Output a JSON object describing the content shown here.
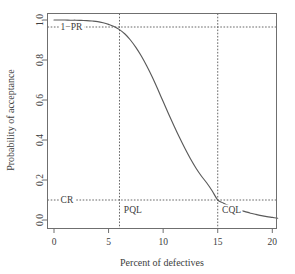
{
  "chart_data": {
    "type": "line",
    "title": "",
    "xlabel": "Percent of defectives",
    "ylabel": "Probability of acceptance",
    "xlim": [
      0,
      20.5
    ],
    "ylim": [
      0.0,
      1.0
    ],
    "grid": false,
    "legend": null,
    "xticks": [
      0,
      5,
      10,
      15,
      20
    ],
    "xtick_labels": [
      "0",
      "5",
      "10",
      "15",
      "20"
    ],
    "yticks": [
      0.0,
      0.2,
      0.4,
      0.6,
      0.8,
      1.0
    ],
    "ytick_labels": [
      "0.0",
      "0.2",
      "0.4",
      "0.6",
      "0.8",
      "1.0"
    ],
    "series": [
      {
        "name": "OC curve",
        "color": "#5a5a5a",
        "x": [
          0.0,
          0.5,
          1.0,
          1.5,
          2.0,
          2.5,
          3.0,
          3.5,
          4.0,
          4.5,
          5.0,
          5.5,
          6.0,
          6.5,
          7.0,
          7.5,
          8.0,
          8.5,
          9.0,
          9.5,
          10.0,
          10.5,
          11.0,
          11.5,
          12.0,
          12.5,
          13.0,
          13.5,
          14.0,
          14.5,
          15.0,
          15.5,
          16.0,
          16.5,
          17.0,
          17.5,
          18.0,
          18.5,
          19.0,
          19.5,
          20.0,
          20.5
        ],
        "y": [
          1.0,
          1.0,
          1.0,
          0.999,
          0.999,
          0.998,
          0.997,
          0.995,
          0.992,
          0.986,
          0.978,
          0.968,
          0.952,
          0.93,
          0.9,
          0.863,
          0.82,
          0.77,
          0.715,
          0.655,
          0.592,
          0.53,
          0.47,
          0.412,
          0.357,
          0.306,
          0.26,
          0.22,
          0.185,
          0.145,
          0.1,
          0.085,
          0.072,
          0.06,
          0.05,
          0.042,
          0.034,
          0.028,
          0.022,
          0.017,
          0.013,
          0.009
        ]
      }
    ],
    "annotations": [
      {
        "id": "one-minus-pr",
        "label": "1−PR",
        "type": "hline",
        "y": 0.965,
        "label_x": 0.6,
        "label_y": 0.965
      },
      {
        "id": "consumer-risk",
        "label": "CR",
        "type": "hline",
        "y": 0.1,
        "label_x": 0.6,
        "label_y": 0.1
      },
      {
        "id": "pql",
        "label": "PQL",
        "type": "vline",
        "x": 6.0,
        "label_x": 6.4,
        "label_y": 0.035
      },
      {
        "id": "cql",
        "label": "CQL",
        "type": "vline",
        "x": 15.0,
        "label_x": 15.4,
        "label_y": 0.035
      }
    ]
  },
  "figure": {
    "background": "#ffffff",
    "frame_color": "#6f6f6f",
    "curve_color": "#5a5a5a",
    "guide_color": "#555555",
    "text_color": "#3d3d3d"
  }
}
